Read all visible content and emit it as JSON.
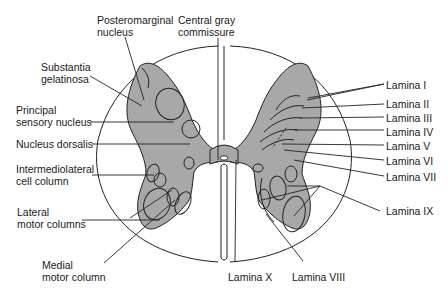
{
  "diagram": {
    "colors": {
      "gray_matter": "#a8a8a8",
      "outline": "#222222",
      "background": "#ffffff"
    },
    "left_labels": {
      "posteromarginal": [
        "Posteromarginal",
        "nucleus"
      ],
      "central_gray": [
        "Central gray",
        "commissure"
      ],
      "substantia": [
        "Substantia",
        "gelatinosa"
      ],
      "principal": [
        "Principal",
        "sensory nucleus"
      ],
      "dorsalis": "Nucleus dorsalis",
      "intermediolateral": [
        "Intermediolateral",
        "cell column"
      ],
      "lateral_motor": [
        "Lateral",
        "motor columns"
      ],
      "medial_motor": [
        "Medial",
        "motor column"
      ]
    },
    "right_labels": {
      "lamina_1": "Lamina I",
      "lamina_2": "Lamina II",
      "lamina_3": "Lamina III",
      "lamina_4": "Lamina IV",
      "lamina_5": "Lamina V",
      "lamina_6": "Lamina VI",
      "lamina_7": "Lamina VII",
      "lamina_9": "Lamina IX",
      "lamina_10": "Lamina X",
      "lamina_8": "Lamina VIII"
    }
  }
}
